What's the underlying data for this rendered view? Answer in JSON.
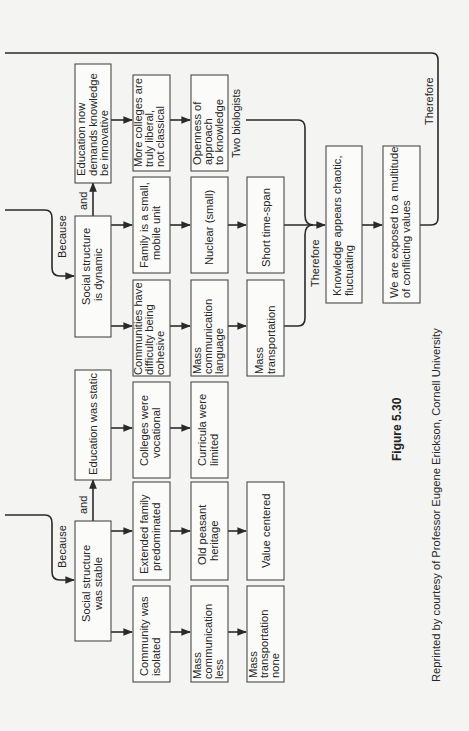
{
  "figure": {
    "label": "Figure 5.30",
    "credit": "Reprinted by courtesy of Professor Eugene Erickson, Cornell University"
  },
  "connectors": {
    "because_top": "Because",
    "because_bottom": "Because",
    "and_top": "and",
    "and_bottom": "and",
    "therefore_mid": "Therefore",
    "therefore_right": "Therefore",
    "two_biologists": "Two biologists"
  },
  "boxes": {
    "edu_now": [
      "Education now",
      "demands  knowledge",
      "be innovative"
    ],
    "social_dynamic": [
      "Social structure",
      "is dynamic"
    ],
    "edu_static": [
      "Education was static"
    ],
    "social_stable": [
      "Social structure",
      "was stable"
    ],
    "more_colleges": [
      "More colleges are",
      "truly liberal,",
      "not classical"
    ],
    "family_small": [
      "Family is a small,",
      "mobile unit"
    ],
    "communities_difficulty": [
      "Communities have",
      "difficulty  being",
      "cohesive"
    ],
    "colleges_vocational": [
      "Colleges were",
      "vocational"
    ],
    "extended_family": [
      "Extended family",
      "predominated"
    ],
    "community_isolated": [
      "Community was",
      "isolated"
    ],
    "openness": [
      "Openness of",
      "approach",
      "to knowledge"
    ],
    "nuclear": [
      "Nuclear (small)"
    ],
    "mass_comm_language": [
      "Mass",
      "communication",
      "language"
    ],
    "curricula_limited": [
      "Curricula were",
      "limited"
    ],
    "old_peasant": [
      "Old peasant",
      "heritage"
    ],
    "mass_comm_less": [
      "Mass",
      "communication",
      "less"
    ],
    "short_time": [
      "Short time-span"
    ],
    "mass_transport": [
      "Mass",
      "transportation"
    ],
    "value_centered": [
      "Value centered"
    ],
    "mass_transport_none": [
      "Mass",
      "transportation",
      "none"
    ],
    "knowledge_chaotic": [
      "Knowledge appears chaotic,",
      "fluctuating"
    ],
    "exposed_values": [
      "We are exposed to a multitude",
      "of conflicting values"
    ]
  }
}
